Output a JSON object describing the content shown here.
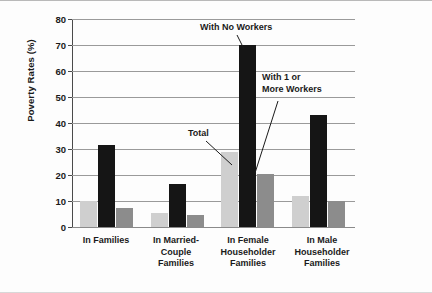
{
  "chart_data": {
    "type": "bar",
    "title": "",
    "xlabel": "",
    "ylabel": "Poverty Rates (%)",
    "ylim": [
      0,
      80
    ],
    "yticks": [
      0,
      10,
      20,
      30,
      40,
      50,
      60,
      70,
      80
    ],
    "ytick_labels": [
      "0",
      "10",
      "20",
      "30",
      "40",
      "50",
      "60",
      "70",
      "80"
    ],
    "grid": "horizontal",
    "legend_position": "none (inline annotations)",
    "categories": [
      "In Families",
      "In Married-Couple Families",
      "In Female Householder Families",
      "In Male Householder Families"
    ],
    "category_label_lines": [
      [
        "In Families"
      ],
      [
        "In Married-Couple",
        "Families"
      ],
      [
        "In Female",
        "Householder",
        "Families"
      ],
      [
        "In Male",
        "Householder",
        "Families"
      ]
    ],
    "series": [
      {
        "name": "Total",
        "color": "#cfcfcf",
        "values": [
          10,
          5.5,
          29,
          12
        ]
      },
      {
        "name": "With No Workers",
        "color": "#151515",
        "values": [
          31.5,
          16.5,
          70,
          43
        ]
      },
      {
        "name": "With 1 or More Workers",
        "color": "#8c8c8c",
        "values": [
          7.5,
          4.5,
          20.5,
          10
        ]
      }
    ],
    "annotations": [
      {
        "text": "With No Workers",
        "lines": [
          "With No Workers"
        ],
        "target_series": "With No Workers",
        "target_category": "In Female Householder Families"
      },
      {
        "text": "Total",
        "lines": [
          "Total"
        ],
        "target_series": "Total",
        "target_category": "In Female Householder Families"
      },
      {
        "text": "With 1 or More Workers",
        "lines": [
          "With 1 or",
          "More Workers"
        ],
        "target_series": "With 1 or More Workers",
        "target_category": "In Female Householder Families"
      }
    ]
  },
  "axis": {
    "ylabel": "Poverty Rates (%)",
    "ticks": [
      "80",
      "70",
      "60",
      "50",
      "40",
      "30",
      "20",
      "10",
      "0"
    ]
  },
  "annotations": {
    "no_workers": "With No Workers",
    "total": "Total",
    "workers_line1": "With 1 or",
    "workers_line2": "More Workers"
  },
  "categories": {
    "g1_l1": "In Families",
    "g2_l1": "In Married-Couple",
    "g2_l2": "Families",
    "g3_l1": "In Female",
    "g3_l2": "Householder",
    "g3_l3": "Families",
    "g4_l1": "In Male",
    "g4_l2": "Householder",
    "g4_l3": "Families"
  },
  "colors": {
    "total": "#cfcfcf",
    "no_workers": "#151515",
    "more_workers": "#8c8c8c",
    "grid": "#9a9a9a",
    "axis": "#4a4a4a"
  }
}
